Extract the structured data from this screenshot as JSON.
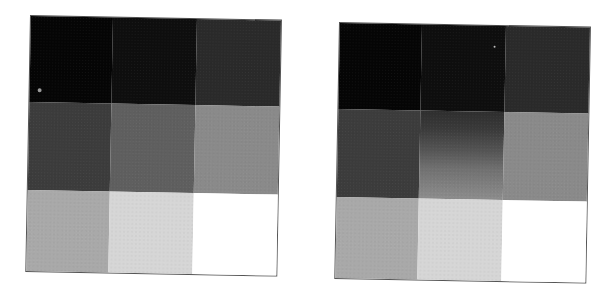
{
  "figure": {
    "panels": [
      {
        "id": "left",
        "grid": [
          [
            "#050505",
            "#0e0e0e",
            "#2a2a2a"
          ],
          [
            "#3c3c3c",
            "#5f5f5f",
            "#8a8a8a"
          ],
          [
            "#a9a9a9",
            "#d6d6d6",
            "#ffffff"
          ]
        ],
        "gradient_cell": null
      },
      {
        "id": "right",
        "grid": [
          [
            "#050505",
            "#0e0e0e",
            "#2a2a2a"
          ],
          [
            "#3c3c3c",
            "gradient",
            "#8a8a8a"
          ],
          [
            "#a9a9a9",
            "#d6d6d6",
            "#ffffff"
          ]
        ],
        "gradient_cell": {
          "row": 1,
          "col": 1,
          "from": "#2e2e2e",
          "to": "#8d8d8d",
          "direction": "top-to-bottom"
        }
      }
    ],
    "border_color": "#555555",
    "background": "#ffffff"
  }
}
